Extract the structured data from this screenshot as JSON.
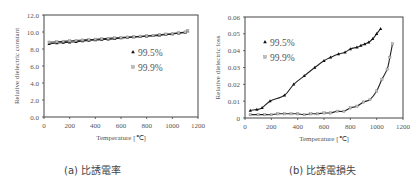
{
  "captions": {
    "a": "(a) 比誘電率",
    "b": "(b) 比誘電損失"
  },
  "chart_data": [
    {
      "type": "scatter",
      "title": "(a) 比誘電率",
      "xlabel": "Temperature [℃]",
      "ylabel": "Relative dielectric constant",
      "xlim": [
        0,
        1200
      ],
      "ylim": [
        0,
        12
      ],
      "xticks": [
        "0",
        "200",
        "400",
        "600",
        "800",
        "1000",
        "1200"
      ],
      "yticks": [
        "0.0",
        "2.0",
        "4.0",
        "6.0",
        "8.0",
        "10.0",
        "12.0"
      ],
      "grid": false,
      "legend": {
        "position": "inside-right",
        "entries": [
          "99.5%",
          "99.9%"
        ]
      },
      "series": [
        {
          "name": "99.5%",
          "marker": "triangle",
          "trendline": true,
          "x": [
            40,
            100,
            150,
            200,
            250,
            300,
            350,
            400,
            450,
            500,
            550,
            600,
            650,
            700,
            750,
            800,
            850,
            900,
            950,
            1000,
            1050,
            1100,
            1120
          ],
          "y": [
            8.6,
            8.7,
            8.75,
            8.8,
            8.85,
            8.95,
            9.0,
            9.05,
            9.1,
            9.15,
            9.2,
            9.3,
            9.35,
            9.4,
            9.45,
            9.5,
            9.55,
            9.6,
            9.7,
            9.75,
            9.85,
            9.95,
            10.1
          ]
        },
        {
          "name": "99.9%",
          "marker": "square",
          "trendline": true,
          "x": [
            40,
            100,
            150,
            200,
            250,
            300,
            350,
            400,
            450,
            500,
            550,
            600,
            650,
            700,
            750,
            800,
            850,
            900,
            950,
            1000,
            1050,
            1100,
            1120
          ],
          "y": [
            8.8,
            8.85,
            8.9,
            8.95,
            9.0,
            9.05,
            9.1,
            9.15,
            9.2,
            9.25,
            9.3,
            9.35,
            9.4,
            9.45,
            9.5,
            9.55,
            9.6,
            9.7,
            9.75,
            9.8,
            9.9,
            10.0,
            10.15
          ]
        }
      ]
    },
    {
      "type": "scatter",
      "title": "(b) 比誘電損失",
      "xlabel": "Temperature [℃]",
      "ylabel": "Relative dielectric loss",
      "xlim": [
        0,
        1200
      ],
      "ylim": [
        0,
        0.06
      ],
      "xticks": [
        "0",
        "200",
        "400",
        "600",
        "800",
        "1000",
        "1200"
      ],
      "yticks": [
        "0",
        "0.01",
        "0.02",
        "0.03",
        "0.04",
        "0.05",
        "0.06"
      ],
      "grid": false,
      "legend": {
        "position": "inside-left",
        "entries": [
          "99.5%",
          "99.9%"
        ]
      },
      "series": [
        {
          "name": "99.5%",
          "marker": "triangle",
          "trendline": true,
          "x": [
            40,
            90,
            130,
            190,
            300,
            370,
            450,
            530,
            600,
            650,
            710,
            760,
            800,
            850,
            880,
            910,
            940,
            970,
            1000,
            1030
          ],
          "y": [
            0.0045,
            0.005,
            0.006,
            0.01,
            0.0135,
            0.02,
            0.025,
            0.03,
            0.034,
            0.036,
            0.038,
            0.039,
            0.041,
            0.042,
            0.043,
            0.044,
            0.045,
            0.047,
            0.05,
            0.053
          ]
        },
        {
          "name": "99.9%",
          "marker": "square",
          "trendline": true,
          "x": [
            40,
            100,
            150,
            200,
            250,
            300,
            350,
            400,
            450,
            500,
            550,
            600,
            650,
            700,
            750,
            800,
            850,
            900,
            950,
            1000,
            1040,
            1080,
            1100,
            1120
          ],
          "y": [
            0.002,
            0.002,
            0.002,
            0.002,
            0.0025,
            0.0025,
            0.0025,
            0.0025,
            0.002,
            0.0025,
            0.0025,
            0.003,
            0.003,
            0.004,
            0.004,
            0.006,
            0.007,
            0.0095,
            0.011,
            0.016,
            0.023,
            0.029,
            0.036,
            0.044
          ]
        }
      ]
    }
  ]
}
